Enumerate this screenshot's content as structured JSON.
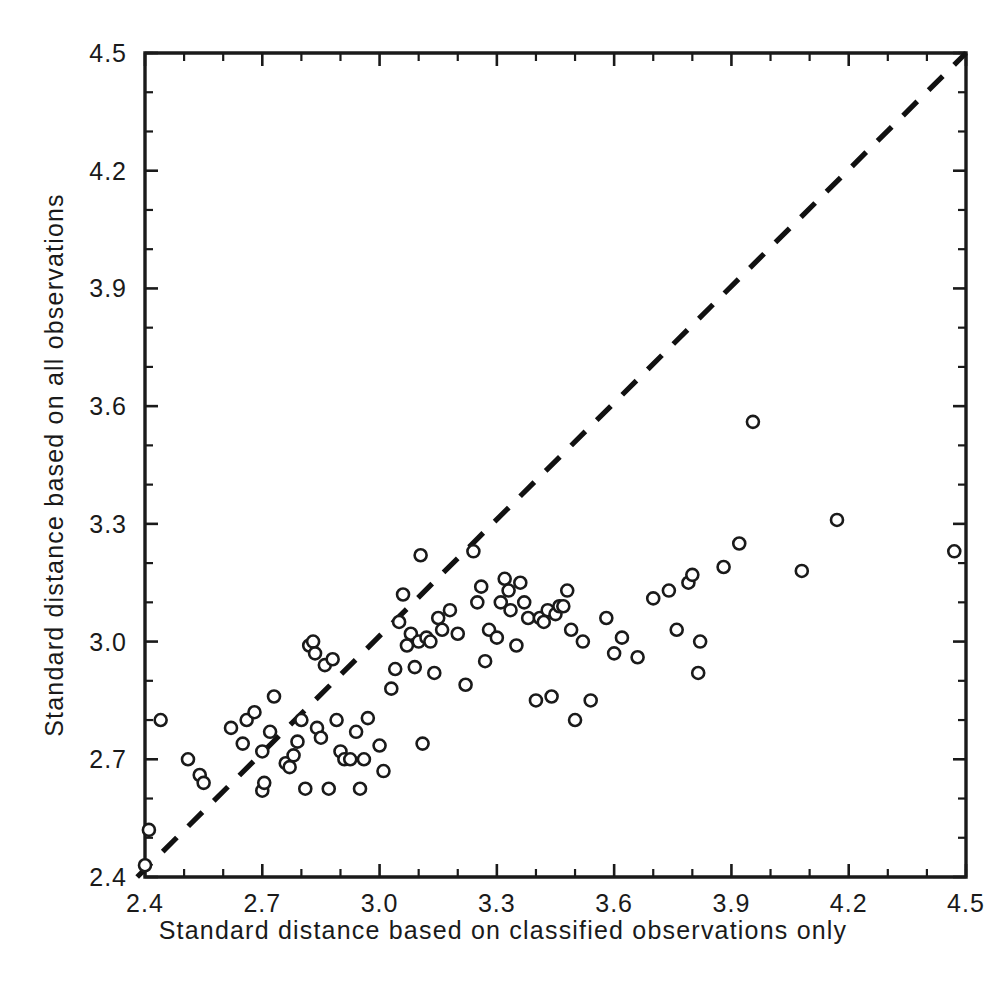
{
  "chart_data": {
    "type": "scatter",
    "title": "",
    "xlabel": "Standard distance based on classified observations only",
    "ylabel": "Standard distance based on all observations",
    "xlim": [
      2.38,
      4.5
    ],
    "ylim": [
      2.4,
      4.5
    ],
    "xticks": [
      2.4,
      2.7,
      3.0,
      3.3,
      3.6,
      3.9,
      4.2,
      4.5
    ],
    "xtick_labels": [
      "2.4",
      "2.7",
      "3.0",
      "3.3",
      "3.6",
      "3.9",
      "4.2",
      "4.5"
    ],
    "yticks": [
      2.4,
      2.7,
      3.0,
      3.3,
      3.6,
      3.9,
      4.2,
      4.5
    ],
    "ytick_labels": [
      "2.4",
      "2.7",
      "3.0",
      "3.3",
      "3.6",
      "3.9",
      "4.2",
      "4.5"
    ],
    "minor_tick_interval": 0.1,
    "grid": false,
    "legend": null,
    "marker": "open-circle",
    "marker_size": 11,
    "annotations": [
      {
        "kind": "reference-line",
        "style": "dashed",
        "label": "y = x",
        "from": [
          2.38,
          2.4
        ],
        "to": [
          4.5,
          4.5
        ]
      }
    ],
    "points": [
      [
        2.4,
        2.43
      ],
      [
        2.41,
        2.52
      ],
      [
        2.44,
        2.8
      ],
      [
        2.51,
        2.7
      ],
      [
        2.54,
        2.66
      ],
      [
        2.55,
        2.64
      ],
      [
        2.62,
        2.78
      ],
      [
        2.65,
        2.74
      ],
      [
        2.66,
        2.8
      ],
      [
        2.68,
        2.82
      ],
      [
        2.7,
        2.72
      ],
      [
        2.7,
        2.62
      ],
      [
        2.705,
        2.64
      ],
      [
        2.72,
        2.77
      ],
      [
        2.73,
        2.86
      ],
      [
        2.76,
        2.69
      ],
      [
        2.77,
        2.68
      ],
      [
        2.78,
        2.71
      ],
      [
        2.79,
        2.745
      ],
      [
        2.8,
        2.8
      ],
      [
        2.81,
        2.625
      ],
      [
        2.82,
        2.99
      ],
      [
        2.83,
        3.0
      ],
      [
        2.835,
        2.97
      ],
      [
        2.84,
        2.78
      ],
      [
        2.85,
        2.755
      ],
      [
        2.86,
        2.94
      ],
      [
        2.87,
        2.625
      ],
      [
        2.88,
        2.955
      ],
      [
        2.89,
        2.8
      ],
      [
        2.9,
        2.72
      ],
      [
        2.91,
        2.7
      ],
      [
        2.925,
        2.7
      ],
      [
        2.94,
        2.77
      ],
      [
        2.95,
        2.625
      ],
      [
        2.96,
        2.7
      ],
      [
        2.97,
        2.805
      ],
      [
        3.0,
        2.735
      ],
      [
        3.01,
        2.67
      ],
      [
        3.03,
        2.88
      ],
      [
        3.04,
        2.93
      ],
      [
        3.05,
        3.05
      ],
      [
        3.06,
        3.12
      ],
      [
        3.07,
        2.99
      ],
      [
        3.08,
        3.02
      ],
      [
        3.09,
        2.935
      ],
      [
        3.1,
        3.0
      ],
      [
        3.105,
        3.22
      ],
      [
        3.11,
        2.74
      ],
      [
        3.12,
        3.01
      ],
      [
        3.13,
        3.0
      ],
      [
        3.14,
        2.92
      ],
      [
        3.15,
        3.06
      ],
      [
        3.16,
        3.03
      ],
      [
        3.18,
        3.08
      ],
      [
        3.2,
        3.02
      ],
      [
        3.22,
        2.89
      ],
      [
        3.24,
        3.23
      ],
      [
        3.25,
        3.1
      ],
      [
        3.26,
        3.14
      ],
      [
        3.27,
        2.95
      ],
      [
        3.28,
        3.03
      ],
      [
        3.3,
        3.01
      ],
      [
        3.31,
        3.1
      ],
      [
        3.32,
        3.16
      ],
      [
        3.33,
        3.13
      ],
      [
        3.335,
        3.08
      ],
      [
        3.35,
        2.99
      ],
      [
        3.36,
        3.15
      ],
      [
        3.37,
        3.1
      ],
      [
        3.38,
        3.06
      ],
      [
        3.4,
        2.85
      ],
      [
        3.41,
        3.06
      ],
      [
        3.42,
        3.05
      ],
      [
        3.43,
        3.08
      ],
      [
        3.44,
        2.86
      ],
      [
        3.45,
        3.07
      ],
      [
        3.46,
        3.09
      ],
      [
        3.47,
        3.09
      ],
      [
        3.48,
        3.13
      ],
      [
        3.49,
        3.03
      ],
      [
        3.5,
        2.8
      ],
      [
        3.52,
        3.0
      ],
      [
        3.54,
        2.85
      ],
      [
        3.58,
        3.06
      ],
      [
        3.6,
        2.97
      ],
      [
        3.62,
        3.01
      ],
      [
        3.66,
        2.96
      ],
      [
        3.7,
        3.11
      ],
      [
        3.74,
        3.13
      ],
      [
        3.76,
        3.03
      ],
      [
        3.79,
        3.15
      ],
      [
        3.8,
        3.17
      ],
      [
        3.815,
        2.92
      ],
      [
        3.82,
        3.0
      ],
      [
        3.88,
        3.19
      ],
      [
        3.92,
        3.25
      ],
      [
        3.955,
        3.56
      ],
      [
        4.08,
        3.18
      ],
      [
        4.17,
        3.31
      ],
      [
        4.47,
        3.23
      ]
    ]
  },
  "colors": {
    "ink": "#1a1a1a",
    "background": "#ffffff",
    "marker_face": "#ffffff",
    "marker_edge": "#1a1a1a",
    "reference_line": "#111111"
  }
}
